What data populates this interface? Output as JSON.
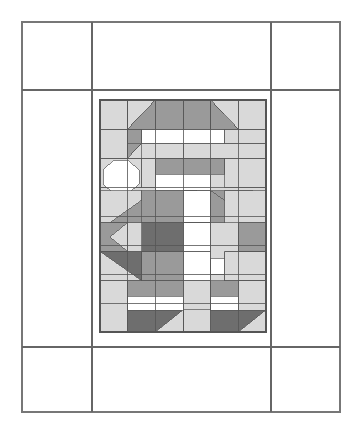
{
  "document": {
    "type": "quilt-block-pattern-diagram",
    "title": "Pieced Figure Quilt Block Layout",
    "background_color": "#ffffff"
  },
  "palette": {
    "white": "#ffffff",
    "light_gray": "#d9d9d9",
    "medium_gray": "#9a9a9a",
    "dark_gray": "#6e6e6e",
    "outline": "#555555",
    "outline_light": "#7a7a7a",
    "frame_line": "#666666"
  },
  "frame": {
    "name": "outer-sashing-frame",
    "x": 22,
    "y": 22,
    "width": 318,
    "height": 390,
    "stroke": "#777777",
    "stroke_width": 1.2,
    "fill": "#ffffff",
    "vertical_dividers_x": [
      92,
      271
    ],
    "horizontal_dividers_y": [
      90,
      347
    ],
    "divider_stroke": "#666666",
    "divider_stroke_width": 1.6,
    "corner_cells": [
      {
        "name": "corner-cell-top-left",
        "x": 22,
        "y": 22,
        "width": 70,
        "height": 68
      },
      {
        "name": "corner-cell-top-right",
        "x": 271,
        "y": 22,
        "width": 69,
        "height": 68
      },
      {
        "name": "corner-cell-bottom-left",
        "x": 22,
        "y": 347,
        "width": 70,
        "height": 65
      },
      {
        "name": "corner-cell-bottom-right",
        "x": 271,
        "y": 347,
        "width": 69,
        "height": 65
      }
    ],
    "sashing_cells": [
      {
        "name": "sashing-top",
        "x": 92,
        "y": 22,
        "width": 179,
        "height": 68
      },
      {
        "name": "sashing-left",
        "x": 22,
        "y": 90,
        "width": 70,
        "height": 257
      },
      {
        "name": "sashing-right",
        "x": 271,
        "y": 90,
        "width": 69,
        "height": 257
      },
      {
        "name": "sashing-bottom",
        "x": 92,
        "y": 347,
        "width": 179,
        "height": 65
      }
    ]
  },
  "block": {
    "name": "center-pieced-block",
    "x": 100,
    "y": 100,
    "width": 166,
    "height": 232,
    "columns": 6,
    "rows": 8,
    "cell_width": 27.67,
    "cell_height": 29,
    "outline": "#555555",
    "description": "Pieced figure composed of half-square triangles, flying geese, rectangles and an octagon face unit"
  },
  "units": [
    {
      "id": "r0c0",
      "name": "unit-sky-left-top",
      "shape": "rect",
      "color": "light_gray",
      "x": 100,
      "y": 100,
      "w": 27.7,
      "h": 29
    },
    {
      "id": "r0c1a",
      "name": "unit-hat-brim-triangle-left",
      "shape": "tri",
      "color": "light_gray",
      "points": "127.7,100 155.3,100 127.7,129"
    },
    {
      "id": "r0c1b",
      "name": "unit-hat-slope-left",
      "shape": "tri",
      "color": "medium_gray",
      "points": "155.3,100 155.3,129 127.7,129"
    },
    {
      "id": "r0c2",
      "name": "unit-hat-crown-center-left",
      "shape": "rect",
      "color": "medium_gray",
      "x": 155.3,
      "y": 100,
      "w": 27.7,
      "h": 29
    },
    {
      "id": "r0c3",
      "name": "unit-hat-crown-center-right",
      "shape": "rect",
      "color": "medium_gray",
      "x": 183,
      "y": 100,
      "w": 27.7,
      "h": 29
    },
    {
      "id": "r0c4a",
      "name": "unit-hat-slope-right",
      "shape": "tri",
      "color": "medium_gray",
      "points": "210.7,100 210.7,129 238.3,129"
    },
    {
      "id": "r0c4b",
      "name": "unit-hat-brim-triangle-right",
      "shape": "tri",
      "color": "light_gray",
      "points": "210.7,100 238.3,100 238.3,129"
    },
    {
      "id": "r0c5",
      "name": "unit-sky-right-top",
      "shape": "rect",
      "color": "light_gray",
      "x": 238.3,
      "y": 100,
      "w": 27.7,
      "h": 29
    },
    {
      "id": "r1c0",
      "name": "unit-sky-left-row1",
      "shape": "rect",
      "color": "light_gray",
      "x": 100,
      "y": 129,
      "w": 27.7,
      "h": 29
    },
    {
      "id": "r1c1a",
      "name": "unit-hat-shadow-left",
      "shape": "tri",
      "color": "medium_gray",
      "points": "127.7,129 155.3,129 127.7,158"
    },
    {
      "id": "r1c1b",
      "name": "unit-hat-fill-left",
      "shape": "tri",
      "color": "light_gray",
      "points": "155.3,129 155.3,158 127.7,158"
    },
    {
      "id": "r1c1c",
      "name": "unit-hat-band-left",
      "shape": "rect",
      "color": "medium_gray",
      "x": 127.7,
      "y": 129,
      "w": 13.8,
      "h": 14.5
    },
    {
      "id": "r1band",
      "name": "unit-hat-band-white",
      "shape": "rect",
      "color": "white",
      "x": 141.5,
      "y": 129,
      "w": 83,
      "h": 14.5
    },
    {
      "id": "r1c4",
      "name": "unit-hat-band-right-gray",
      "shape": "rect",
      "color": "light_gray",
      "x": 224.5,
      "y": 129,
      "w": 41.5,
      "h": 14.5
    },
    {
      "id": "r1lower-l",
      "name": "unit-below-band-left",
      "shape": "rect",
      "color": "light_gray",
      "x": 141.5,
      "y": 143.5,
      "w": 41.5,
      "h": 14.5
    },
    {
      "id": "r1lower-r",
      "name": "unit-below-band-right",
      "shape": "rect",
      "color": "light_gray",
      "x": 183,
      "y": 143.5,
      "w": 83,
      "h": 14.5
    },
    {
      "id": "r2c0",
      "name": "unit-face-corner-nw",
      "shape": "rect",
      "color": "light_gray",
      "x": 100,
      "y": 158,
      "w": 41.5,
      "h": 29
    },
    {
      "id": "r2face",
      "name": "unit-face-octagon",
      "shape": "octagon",
      "color": "white",
      "x": 103,
      "y": 160,
      "w": 36,
      "h": 34
    },
    {
      "id": "r2c2",
      "name": "unit-forehead-gray",
      "shape": "rect",
      "color": "light_gray",
      "x": 141.5,
      "y": 158,
      "w": 41.5,
      "h": 29
    },
    {
      "id": "r2brow",
      "name": "unit-brow-band-gray",
      "shape": "rect",
      "color": "medium_gray",
      "x": 155.3,
      "y": 158,
      "w": 69.2,
      "h": 16
    },
    {
      "id": "r2beard",
      "name": "unit-beard-white",
      "shape": "rect",
      "color": "white",
      "x": 155.3,
      "y": 174,
      "w": 55.4,
      "h": 16.5
    },
    {
      "id": "r2c5",
      "name": "unit-face-corner-ne",
      "shape": "rect",
      "color": "light_gray",
      "x": 224.5,
      "y": 158,
      "w": 41.5,
      "h": 29
    },
    {
      "id": "r3c0",
      "name": "unit-shoulder-left-bg",
      "shape": "rect",
      "color": "light_gray",
      "x": 100,
      "y": 190.5,
      "w": 41.5,
      "h": 32
    },
    {
      "id": "r3shl",
      "name": "unit-shoulder-slope-left",
      "shape": "tri",
      "color": "medium_gray",
      "points": "110,222.5 155.3,190.5 155.3,222.5"
    },
    {
      "id": "r3torso-l",
      "name": "unit-torso-upper-left",
      "shape": "rect",
      "color": "medium_gray",
      "x": 141.5,
      "y": 190.5,
      "w": 41.5,
      "h": 32
    },
    {
      "id": "r3collar-l",
      "name": "unit-collar-left",
      "shape": "tri",
      "color": "medium_gray",
      "points": "183,190.5 196.8,190.5 183,204"
    },
    {
      "id": "r3collar-c",
      "name": "unit-collar-center-white",
      "shape": "rect",
      "color": "white",
      "x": 183,
      "y": 190.5,
      "w": 27.7,
      "h": 32
    },
    {
      "id": "r3torso-r",
      "name": "unit-torso-upper-right",
      "shape": "rect",
      "color": "medium_gray",
      "x": 210.7,
      "y": 190.5,
      "w": 41.5,
      "h": 32
    },
    {
      "id": "r3shr",
      "name": "unit-shoulder-slope-right",
      "shape": "tri",
      "color": "medium_gray",
      "points": "210.7,190.5 256,222.5 210.7,222.5"
    },
    {
      "id": "r3c5",
      "name": "unit-shoulder-right-bg",
      "shape": "rect",
      "color": "light_gray",
      "x": 224.5,
      "y": 190.5,
      "w": 41.5,
      "h": 32
    },
    {
      "id": "r4c0",
      "name": "unit-arm-left-outer",
      "shape": "rect",
      "color": "medium_gray",
      "x": 100,
      "y": 222.5,
      "w": 27.7,
      "h": 29
    },
    {
      "id": "r4arrow-l",
      "name": "unit-arm-arrow-left",
      "shape": "tri",
      "color": "light_gray",
      "points": "127.7,222.5 110,237 127.7,251.5"
    },
    {
      "id": "r4torso",
      "name": "unit-belt-dark",
      "shape": "rect",
      "color": "dark_gray",
      "x": 141.5,
      "y": 222.5,
      "w": 69.2,
      "h": 29
    },
    {
      "id": "r4buckle",
      "name": "unit-buckle-white",
      "shape": "rect",
      "color": "white",
      "x": 183,
      "y": 222.5,
      "w": 27.7,
      "h": 29
    },
    {
      "id": "r4arrow-r",
      "name": "unit-arm-arrow-right",
      "shape": "tri",
      "color": "light_gray",
      "points": "238.3,222.5 256,237 238.3,251.5"
    },
    {
      "id": "r4c5",
      "name": "unit-arm-right-outer",
      "shape": "rect",
      "color": "medium_gray",
      "x": 238.3,
      "y": 222.5,
      "w": 27.7,
      "h": 29
    },
    {
      "id": "r5c0",
      "name": "unit-mitten-left-bg",
      "shape": "rect",
      "color": "light_gray",
      "x": 100,
      "y": 251.5,
      "w": 41.5,
      "h": 29
    },
    {
      "id": "r5mit-l",
      "name": "unit-mitten-left-dark",
      "shape": "tri",
      "color": "dark_gray",
      "points": "100,251.5 141.5,251.5 141.5,280.5"
    },
    {
      "id": "r5cuff-l",
      "name": "unit-cuff-left-white",
      "shape": "rect",
      "color": "white",
      "x": 141.5,
      "y": 258,
      "w": 41.5,
      "h": 16
    },
    {
      "id": "r5body",
      "name": "unit-coat-lower-left",
      "shape": "rect",
      "color": "medium_gray",
      "x": 141.5,
      "y": 251.5,
      "w": 41.5,
      "h": 29
    },
    {
      "id": "r5center",
      "name": "unit-coat-center-white",
      "shape": "rect",
      "color": "white",
      "x": 183,
      "y": 251.5,
      "w": 27.7,
      "h": 29
    },
    {
      "id": "r5cuff-r",
      "name": "unit-cuff-right-white",
      "shape": "rect",
      "color": "white",
      "x": 210.7,
      "y": 258,
      "w": 41.5,
      "h": 16
    },
    {
      "id": "r5mit-r",
      "name": "unit-mitten-right-dark",
      "shape": "tri",
      "color": "dark_gray",
      "points": "266,251.5 224.5,251.5 224.5,280.5"
    },
    {
      "id": "r5c5",
      "name": "unit-mitten-right-bg",
      "shape": "rect",
      "color": "light_gray",
      "x": 224.5,
      "y": 251.5,
      "w": 41.5,
      "h": 29
    },
    {
      "id": "r6c0",
      "name": "unit-bg-left-lower",
      "shape": "rect",
      "color": "light_gray",
      "x": 100,
      "y": 280.5,
      "w": 27.7,
      "h": 51.5
    },
    {
      "id": "r6leg-l",
      "name": "unit-leg-left-gray",
      "shape": "rect",
      "color": "medium_gray",
      "x": 127.7,
      "y": 280.5,
      "w": 55.3,
      "h": 22
    },
    {
      "id": "r6boot-stripe-l",
      "name": "unit-boot-stripe-left",
      "shape": "rect",
      "color": "white",
      "x": 127.7,
      "y": 296,
      "w": 55.3,
      "h": 14
    },
    {
      "id": "r6c3",
      "name": "unit-leg-center-light",
      "shape": "rect",
      "color": "light_gray",
      "x": 183,
      "y": 280.5,
      "w": 27.7,
      "h": 29
    },
    {
      "id": "r6leg-r",
      "name": "unit-leg-right-gray",
      "shape": "rect",
      "color": "medium_gray",
      "x": 210.7,
      "y": 280.5,
      "w": 55.3,
      "h": 22
    },
    {
      "id": "r6boot-stripe-r",
      "name": "unit-boot-stripe-right",
      "shape": "rect",
      "color": "white",
      "x": 210.7,
      "y": 296,
      "w": 55.3,
      "h": 14
    },
    {
      "id": "r6c5",
      "name": "unit-bg-right-lower",
      "shape": "rect",
      "color": "light_gray",
      "x": 238.3,
      "y": 280.5,
      "w": 27.7,
      "h": 51.5
    },
    {
      "id": "r7boot-l",
      "name": "unit-boot-left-dark",
      "shape": "rect",
      "color": "dark_gray",
      "x": 127.7,
      "y": 310,
      "w": 55.3,
      "h": 22
    },
    {
      "id": "r7boot-l-toe",
      "name": "unit-boot-left-toe",
      "shape": "tri",
      "color": "light_gray",
      "points": "183,310 183,332 155.3,332"
    },
    {
      "id": "r7boot-r",
      "name": "unit-boot-right-dark",
      "shape": "rect",
      "color": "dark_gray",
      "x": 210.7,
      "y": 310,
      "w": 55.3,
      "h": 22
    },
    {
      "id": "r7boot-r-toe",
      "name": "unit-boot-right-toe",
      "shape": "tri",
      "color": "light_gray",
      "points": "266,310 238.3,332 266,332"
    }
  ],
  "legend": {
    "colors_used": [
      "#ffffff",
      "#d9d9d9",
      "#9a9a9a",
      "#6e6e6e"
    ],
    "color_names": [
      "white",
      "light gray",
      "medium gray",
      "dark gray"
    ]
  }
}
